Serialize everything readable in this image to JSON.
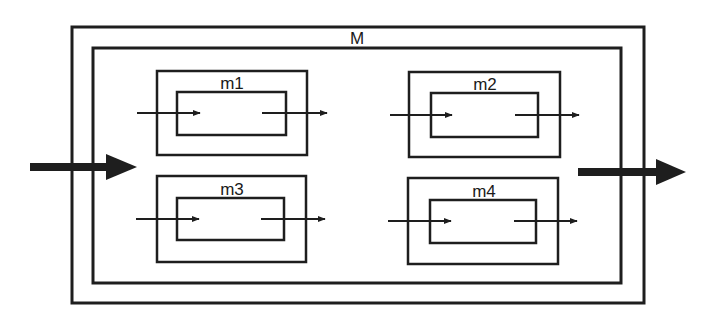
{
  "diagram": {
    "stroke_color": "#1e1e1e",
    "background": "#ffffff",
    "outer_module": {
      "label": "M"
    },
    "submodules": [
      {
        "id": "m1",
        "label": "m1"
      },
      {
        "id": "m2",
        "label": "m2"
      },
      {
        "id": "m3",
        "label": "m3"
      },
      {
        "id": "m4",
        "label": "m4"
      }
    ],
    "icons": {
      "input_arrow": "arrow-right-icon",
      "output_arrow": "arrow-right-icon"
    }
  }
}
